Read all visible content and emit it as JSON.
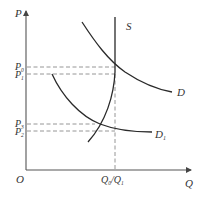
{
  "diagram": {
    "type": "supply-demand",
    "axes": {
      "y_label": "P",
      "x_label": "Q",
      "origin_label": "O"
    },
    "curves": {
      "supply": {
        "label": "S"
      },
      "demand": {
        "label": "D"
      },
      "demand_shifted": {
        "label": "D",
        "subscript": "1"
      }
    },
    "price_levels": [
      {
        "label": "P",
        "subscript": "0"
      },
      {
        "label": "P",
        "subscript": "1"
      },
      {
        "label": "P",
        "subscript": "3"
      },
      {
        "label": "P",
        "subscript": "2"
      }
    ],
    "quantity_label": {
      "a": "Q",
      "a_sub": "0",
      "sep": "/",
      "b": "Q",
      "b_sub": "1"
    },
    "colors": {
      "curve": "#2a2a2a",
      "axis": "#555555",
      "dashed": "#8a8a8a",
      "text": "#333333"
    }
  }
}
